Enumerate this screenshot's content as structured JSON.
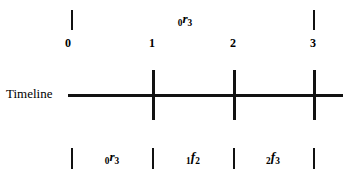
{
  "figure": {
    "axis_name": "Timeline",
    "time_points": [
      {
        "label": "0",
        "x": 68
      },
      {
        "label": "1",
        "x": 152
      },
      {
        "label": "2",
        "x": 233
      },
      {
        "label": "3",
        "x": 313
      }
    ],
    "top_interval": {
      "name": "relation-0-r-3",
      "prefix": "0",
      "relation": "r",
      "suffix": "3",
      "text": "0r3",
      "center_x": 185,
      "bracket_ticks": [
        71,
        313
      ]
    },
    "bottom_intervals": [
      {
        "name": "relation-0-r-3",
        "prefix": "0",
        "relation": "r",
        "suffix": "3",
        "text": "0r3",
        "center_x": 112
      },
      {
        "name": "relation-1-f-2",
        "prefix": "1",
        "relation": "f",
        "suffix": "2",
        "text": "1f2",
        "center_x": 193
      },
      {
        "name": "relation-2-f-3",
        "prefix": "2",
        "relation": "f",
        "suffix": "3",
        "text": "2f3",
        "center_x": 273
      }
    ],
    "bottom_bracket_ticks": [
      71,
      152,
      233,
      313
    ],
    "axis_ticks": [
      152,
      233,
      313
    ],
    "axis_line": {
      "x_start": 68,
      "x_end": 343,
      "y": 94
    },
    "colors": {
      "ink": "#111111",
      "background": "#ffffff"
    }
  }
}
